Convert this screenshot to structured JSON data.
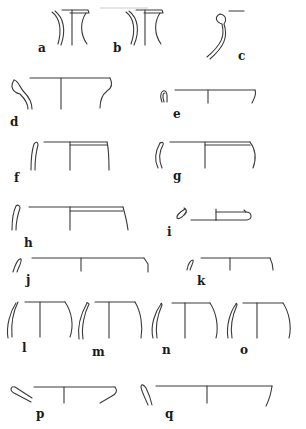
{
  "figure": {
    "type": "pottery rim profiles",
    "stroke_color": "#3a3a3a",
    "background": "#ffffff",
    "profiles": [
      {
        "id": "a",
        "label": "a"
      },
      {
        "id": "b",
        "label": "b"
      },
      {
        "id": "c",
        "label": "c"
      },
      {
        "id": "d",
        "label": "d"
      },
      {
        "id": "e",
        "label": "e"
      },
      {
        "id": "f",
        "label": "f"
      },
      {
        "id": "g",
        "label": "g"
      },
      {
        "id": "h",
        "label": "h"
      },
      {
        "id": "i",
        "label": "i"
      },
      {
        "id": "j",
        "label": "j"
      },
      {
        "id": "k",
        "label": "k"
      },
      {
        "id": "l",
        "label": "l"
      },
      {
        "id": "m",
        "label": "m"
      },
      {
        "id": "n",
        "label": "n"
      },
      {
        "id": "o",
        "label": "o"
      },
      {
        "id": "p",
        "label": "p"
      },
      {
        "id": "q",
        "label": "q"
      }
    ]
  }
}
